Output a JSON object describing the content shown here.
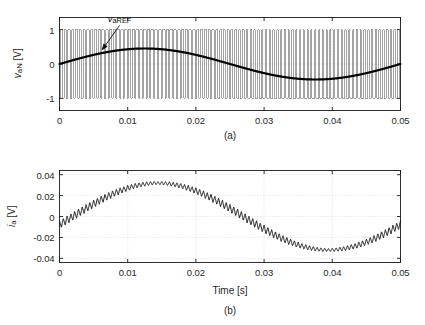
{
  "figure": {
    "background": "#ffffff",
    "line_color": "#1a1a1a",
    "grid_color": "#c8c8c8",
    "pwm_color": "#5a5a5a"
  },
  "chart_data": [
    {
      "id": "panel-a",
      "type": "line",
      "caption": "(a)",
      "title": "",
      "xlabel": "",
      "ylabel": "v_aN [V]",
      "ylabel_parts": {
        "main": "v",
        "sub": "aN",
        "unit": " [V]"
      },
      "xlim": [
        0,
        0.05
      ],
      "ylim": [
        -1.35,
        1.35
      ],
      "xticks": [
        0,
        0.01,
        0.02,
        0.03,
        0.04,
        0.05
      ],
      "xticklabels": [
        "0",
        "0.01",
        "0.02",
        "0.03",
        "0.04",
        "0.05"
      ],
      "yticks": [
        -1,
        0,
        1
      ],
      "yticklabels": [
        "-1",
        "0",
        "1"
      ],
      "grid": true,
      "annotations": [
        {
          "text": "v_aREF",
          "text_parts": {
            "main": "v",
            "sub": "aREF"
          },
          "label_x": 0.0088,
          "label_y": 1.33,
          "arrow_from_x": 0.0088,
          "arrow_from_y": 1.12,
          "arrow_to_x": 0.0063,
          "arrow_to_y": 0.42
        }
      ],
      "series": [
        {
          "name": "v_aN PWM switched waveform",
          "kind": "pwm",
          "color": "#5a5a5a",
          "description": "Two-level PWM pulse train switching between -1 V and +1 V, carrier ~1.8 kHz, modulated by a 20 Hz reference of amplitude 0.45",
          "carrier_freq_hz": 1800,
          "fundamental_freq_hz": 20,
          "modulation_index": 0.45,
          "high_level": 1,
          "low_level": -1
        },
        {
          "name": "v_aREF reference",
          "kind": "sine",
          "color": "#000000",
          "linewidth": 2.2,
          "amplitude": 0.45,
          "freq_hz": 20,
          "phase_deg": 0
        }
      ]
    },
    {
      "id": "panel-b",
      "type": "line",
      "caption": "(b)",
      "title": "",
      "xlabel": "Time [s]",
      "ylabel": "i_a [V]",
      "ylabel_parts": {
        "main": "i",
        "sub": "a",
        "unit": " [V]"
      },
      "xlim": [
        0,
        0.05
      ],
      "ylim": [
        -0.044,
        0.044
      ],
      "xticks": [
        0,
        0.01,
        0.02,
        0.03,
        0.04,
        0.05
      ],
      "xticklabels": [
        "0",
        "0.01",
        "0.02",
        "0.03",
        "0.04",
        "0.05"
      ],
      "yticks": [
        -0.04,
        -0.02,
        0,
        0.02,
        0.04
      ],
      "yticklabels": [
        "-0.04",
        "-0.02",
        "0",
        "0.02",
        "0.04"
      ],
      "grid": true,
      "series": [
        {
          "name": "i_a output current",
          "kind": "sine-with-ripple",
          "color": "#1a1a1a",
          "linewidth": 1,
          "amplitude": 0.032,
          "freq_hz": 20,
          "phase_deg": -14,
          "ripple_amplitude": 0.0032,
          "ripple_freq_hz": 1800
        }
      ]
    }
  ]
}
